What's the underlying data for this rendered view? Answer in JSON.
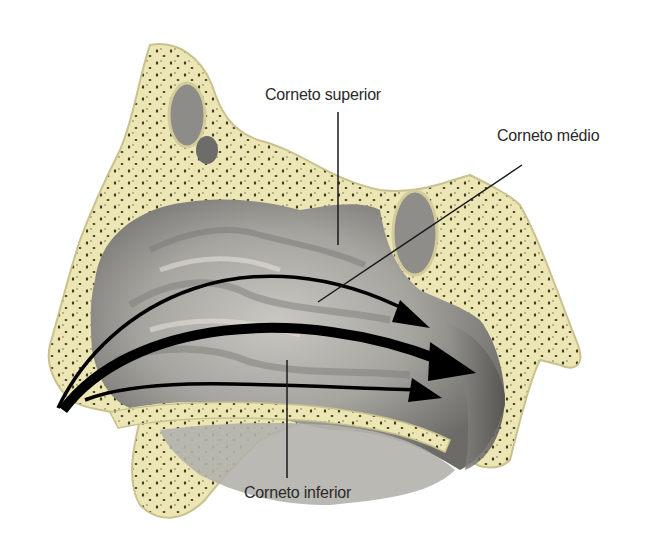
{
  "diagram": {
    "labels": {
      "superior": "Corneto superior",
      "middle": "Corneto médio",
      "inferior": "Corneto inferior"
    },
    "arrows": [
      {
        "name": "upper-airflow",
        "thickness": "thin"
      },
      {
        "name": "main-airflow",
        "thickness": "thick"
      },
      {
        "name": "lower-airflow",
        "thickness": "thin"
      }
    ],
    "colors": {
      "bone": "#ece6b4",
      "bone_dots": "#3d3a22",
      "mucosa": "#a9a7a2",
      "mucosa_dark": "#6f6d69",
      "arrow": "#000000",
      "label_text": "#2a2a2a"
    }
  }
}
